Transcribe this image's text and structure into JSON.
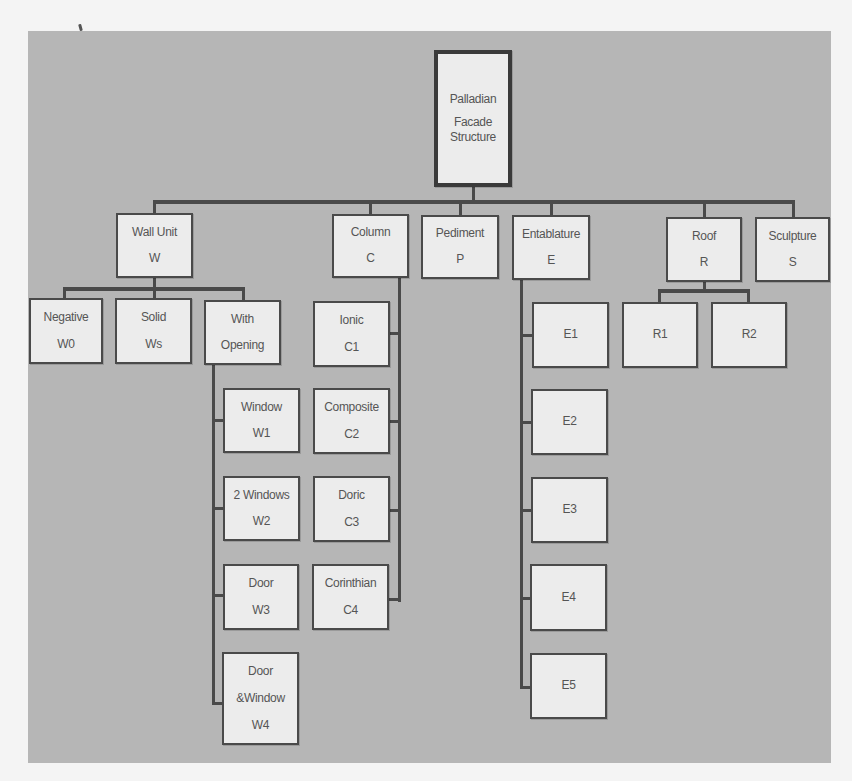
{
  "diagram": {
    "title": "Palladian Facade Structure",
    "root": {
      "lines": [
        "Palladian",
        "Facade",
        "Structure"
      ]
    },
    "level1": [
      {
        "id": "W",
        "label": "Wall Unit",
        "code": "W"
      },
      {
        "id": "C",
        "label": "Column",
        "code": "C"
      },
      {
        "id": "P",
        "label": "Pediment",
        "code": "P"
      },
      {
        "id": "E",
        "label": "Entablature",
        "code": "E"
      },
      {
        "id": "R",
        "label": "Roof",
        "code": "R"
      },
      {
        "id": "S",
        "label": "Sculpture",
        "code": "S"
      }
    ],
    "wall_children": [
      {
        "label": "Negative",
        "code": "W0"
      },
      {
        "label": "Solid",
        "code": "Ws"
      },
      {
        "label": "With",
        "label2": "Opening"
      }
    ],
    "opening_children": [
      {
        "label": "Window",
        "code": "W1"
      },
      {
        "label": "2 Windows",
        "code": "W2"
      },
      {
        "label": "Door",
        "code": "W3"
      },
      {
        "label": "Door",
        "label2": "&Window",
        "code": "W4"
      }
    ],
    "column_children": [
      {
        "label": "Ionic",
        "code": "C1"
      },
      {
        "label": "Composite",
        "code": "C2"
      },
      {
        "label": "Doric",
        "code": "C3"
      },
      {
        "label": "Corinthian",
        "code": "C4"
      }
    ],
    "entablature_children": [
      {
        "code": "E1"
      },
      {
        "code": "E2"
      },
      {
        "code": "E3"
      },
      {
        "code": "E4"
      },
      {
        "code": "E5"
      }
    ],
    "roof_children": [
      {
        "code": "R1"
      },
      {
        "code": "R2"
      }
    ]
  }
}
